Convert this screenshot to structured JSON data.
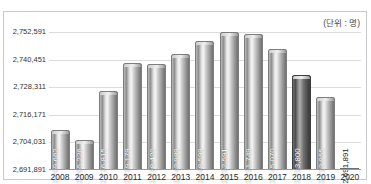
{
  "top_strip_text": "",
  "unit_label": "(단위 : 명)",
  "chart_data": {
    "type": "bar",
    "title": "",
    "subtitle": "",
    "xlabel": "",
    "ylabel": "",
    "unit": "(단위 : 명)",
    "grid": true,
    "legend": null,
    "ylim": [
      2691891,
      2752591
    ],
    "ytick_labels": [
      "2,752,591",
      "2,740,451",
      "2,728,311",
      "2,716,171",
      "2,704,031",
      "2,691,891"
    ],
    "yticks": [
      2752591,
      2740451,
      2728311,
      2716171,
      2704031,
      2691891
    ],
    "categories": [
      "2008",
      "2009",
      "2010",
      "2011",
      "2012",
      "2013",
      "2014",
      "2015",
      "2016",
      "2017",
      "2018",
      "2019",
      "2020"
    ],
    "values": [
      2709662,
      2705226,
      2726815,
      2739179,
      2738420,
      2742989,
      2748599,
      2752591,
      2751749,
      2745070,
      2733800,
      2723955,
      2691891
    ],
    "value_labels": [
      "2,709,662",
      "2,705,226",
      "2,726,815",
      "2,739,179",
      "2,738,420",
      "2,742,989",
      "2,748,599",
      "2,752,591",
      "2,751,749",
      "2,745,070",
      "2,733,800",
      "2,723,955",
      "2,691,891"
    ],
    "bar_styles": [
      "light",
      "light",
      "light",
      "light",
      "light",
      "light",
      "light",
      "light",
      "light",
      "light",
      "dark",
      "light",
      "flat"
    ],
    "colors": {
      "bar_light": "#b0b0b0",
      "bar_dark": "#4d4d4d",
      "grid": "#dcdcdc",
      "axis": "#9a9a9a",
      "frame": "#c9c9cd",
      "value_text": "#ffffff",
      "tick_text": "#333333"
    }
  }
}
